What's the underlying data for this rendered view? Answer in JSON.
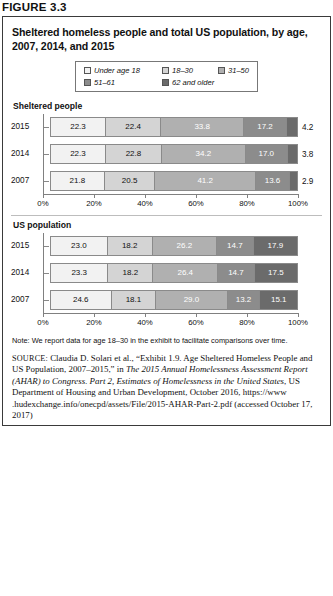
{
  "figure": {
    "label": "FIGURE 3.3",
    "title": "Sheltered homeless people and total US population, by age, 2007, 2014, and 2015"
  },
  "legend": {
    "items": [
      {
        "label": "Under age 18",
        "color": "#f2f2f2"
      },
      {
        "label": "18–30",
        "color": "#d4d4d4"
      },
      {
        "label": "31–50",
        "color": "#b0b0b0"
      },
      {
        "label": "51–61",
        "color": "#8c8c8c"
      },
      {
        "label": "62 and older",
        "color": "#6b6b6b"
      }
    ]
  },
  "axis": {
    "ticks": [
      "0%",
      "20%",
      "40%",
      "60%",
      "80%",
      "100%"
    ],
    "min": 0,
    "max": 100
  },
  "charts": [
    {
      "heading": "Sheltered people",
      "rows": [
        {
          "year": "2015",
          "values": [
            "22.3",
            "22.4",
            "33.8",
            "17.2",
            "4.2"
          ]
        },
        {
          "year": "2014",
          "values": [
            "22.3",
            "22.8",
            "34.2",
            "17.0",
            "3.8"
          ]
        },
        {
          "year": "2007",
          "values": [
            "21.8",
            "20.5",
            "41.2",
            "13.6",
            "2.9"
          ]
        }
      ]
    },
    {
      "heading": "US population",
      "rows": [
        {
          "year": "2015",
          "values": [
            "23.0",
            "18.2",
            "26.2",
            "14.7",
            "17.9"
          ]
        },
        {
          "year": "2014",
          "values": [
            "23.3",
            "18.2",
            "26.4",
            "14.7",
            "17.5"
          ]
        },
        {
          "year": "2007",
          "values": [
            "24.6",
            "18.1",
            "29.0",
            "13.2",
            "15.1"
          ]
        }
      ]
    }
  ],
  "note": "Note: We report data for age 18–30 in the exhibit to facilitate comparisons over time.",
  "source": {
    "tag": "SOURCE:",
    "part1": " Claudia D. Solari et al., “Exhibit 1.9. Age Sheltered Homeless People and US Population, 2007–2015,” in ",
    "italic1": "The 2015 Annual Homelessness Assessment Report (AHAR) to Congress. Part 2, Estimates of Homelessness in the United States",
    "part2": ", US Department of Housing and Urban Development, October 2016, https://www .hudexchange.info/onecpd/assets/File/2015-AHAR-Part-2.pdf (accessed October 17, 2017)"
  },
  "chart_data": {
    "type": "bar",
    "title": "Sheltered homeless people and total US population, by age, 2007, 2014, and 2015",
    "xlabel": "",
    "ylabel": "",
    "xlim": [
      0,
      100
    ],
    "grid": false,
    "legend_position": "top-center",
    "orientation": "horizontal-stacked",
    "categories": [
      "2015",
      "2014",
      "2007"
    ],
    "legend": [
      "Under age 18",
      "18–30",
      "31–50",
      "51–61",
      "62 and older"
    ],
    "panels": [
      {
        "name": "Sheltered people",
        "series": [
          {
            "name": "Under age 18",
            "values": [
              22.3,
              22.3,
              21.8
            ]
          },
          {
            "name": "18–30",
            "values": [
              22.4,
              22.8,
              20.5
            ]
          },
          {
            "name": "31–50",
            "values": [
              33.8,
              34.2,
              41.2
            ]
          },
          {
            "name": "51–61",
            "values": [
              17.2,
              17.0,
              13.6
            ]
          },
          {
            "name": "62 and older",
            "values": [
              4.2,
              3.8,
              2.9
            ]
          }
        ]
      },
      {
        "name": "US population",
        "series": [
          {
            "name": "Under age 18",
            "values": [
              23.0,
              23.3,
              24.6
            ]
          },
          {
            "name": "18–30",
            "values": [
              18.2,
              18.2,
              18.1
            ]
          },
          {
            "name": "31–50",
            "values": [
              26.2,
              26.4,
              29.0
            ]
          },
          {
            "name": "51–61",
            "values": [
              14.7,
              14.7,
              13.2
            ]
          },
          {
            "name": "62 and older",
            "values": [
              17.9,
              17.5,
              15.1
            ]
          }
        ]
      }
    ],
    "tick_labels": [
      "0%",
      "20%",
      "40%",
      "60%",
      "80%",
      "100%"
    ]
  }
}
